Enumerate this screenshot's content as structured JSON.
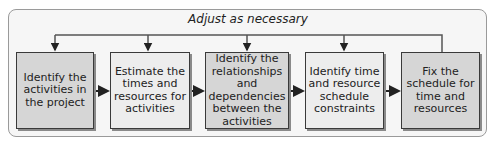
{
  "diagram": {
    "feedback_label": "Adjust as necessary",
    "steps": [
      {
        "label": "Identify the activities in the project"
      },
      {
        "label": "Estimate the times and resources for activities"
      },
      {
        "label": "Identify the relationships and dependencies between the activities"
      },
      {
        "label": "Identify time and resource schedule constraints"
      },
      {
        "label": "Fix the schedule for time and resources"
      }
    ],
    "colors": {
      "box_dark": "#d6d6d6",
      "box_light": "#ededed",
      "line": "#333333",
      "frame_border": "#9a9a9a"
    }
  }
}
